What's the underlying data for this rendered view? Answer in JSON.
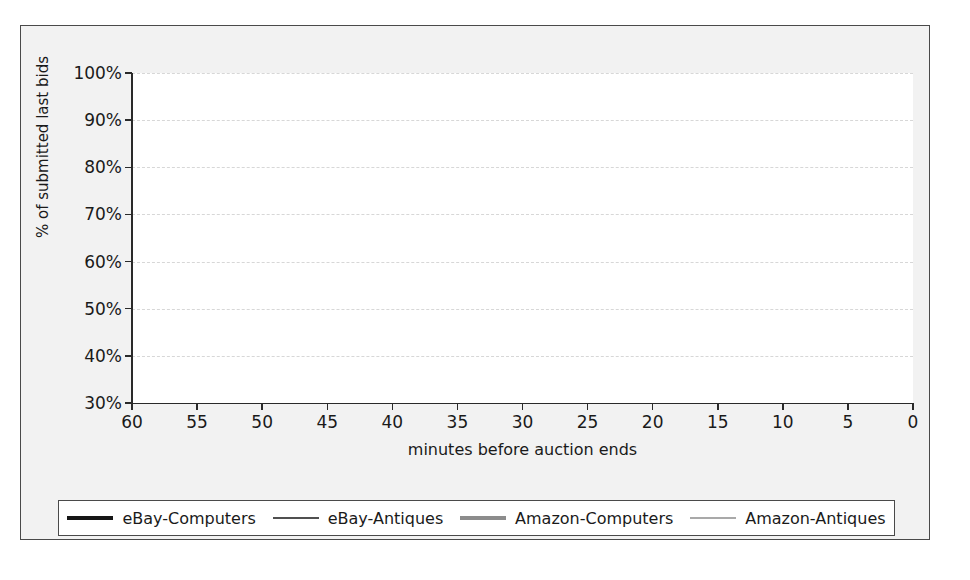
{
  "figure": {
    "background_color": "#f2f2f2",
    "plot_background_color": "#ffffff",
    "frame_color": "#4a4a4a"
  },
  "legend": {
    "position": "bottom",
    "items": [
      {
        "label": "eBay-Computers",
        "color": "#161616",
        "width": 4.2,
        "icon": "thick-black-line-icon"
      },
      {
        "label": "eBay-Antiques",
        "color": "#161616",
        "width": 1.4,
        "icon": "thin-black-line-icon"
      },
      {
        "label": "Amazon-Computers",
        "color": "#8c8c8c",
        "width": 4.2,
        "icon": "thick-gray-line-icon"
      },
      {
        "label": "Amazon-Antiques",
        "color": "#8c8c8c",
        "width": 1.4,
        "icon": "thin-gray-line-icon"
      }
    ]
  },
  "chart_data": {
    "type": "line",
    "title": "",
    "subtitle": "",
    "xlabel": "minutes before auction ends",
    "ylabel": "% of submitted last bids",
    "xlim": [
      60,
      0
    ],
    "ylim": [
      30,
      100
    ],
    "x_reversed": true,
    "grid": true,
    "gridlines": "horizontal-dashed",
    "xticks": [
      60,
      55,
      50,
      45,
      40,
      35,
      30,
      25,
      20,
      15,
      10,
      5,
      0
    ],
    "xtick_labels": [
      "60",
      "55",
      "50",
      "45",
      "40",
      "35",
      "30",
      "25",
      "20",
      "15",
      "10",
      "5",
      "0"
    ],
    "yticks": [
      30,
      40,
      50,
      60,
      70,
      80,
      90,
      100
    ],
    "ytick_labels": [
      "30%",
      "40%",
      "50%",
      "60%",
      "70%",
      "80%",
      "90%",
      "100%"
    ],
    "legend_position": "bottom-outside",
    "annotations": [],
    "series": [
      {
        "name": "eBay-Computers",
        "color": "#161616",
        "width": 4.2,
        "style": "step",
        "x": [
          60,
          57,
          55,
          54.5,
          52,
          50,
          49,
          47.5,
          46.5,
          45.5,
          44.5,
          43.5,
          42.5,
          41.5,
          40.5,
          39.5,
          38.5,
          37.5,
          36.5,
          35.5,
          34.5,
          33.5,
          32.5,
          31.5,
          30.5,
          29.5,
          28.5,
          27.5,
          26.5,
          25.5,
          24.5,
          23.5,
          22.5,
          21.5,
          20.5,
          19.5,
          18.5,
          17.5,
          17,
          13,
          12,
          11,
          10.5,
          10,
          9.5,
          9,
          8.5,
          8,
          7.5,
          7,
          6.5,
          6,
          5.5,
          5,
          4.5,
          4,
          3.5,
          3,
          2.5,
          2,
          1.5,
          1,
          0.6,
          0.3,
          0
        ],
        "y": [
          34.0,
          34.0,
          34.0,
          34.8,
          34.8,
          35.4,
          35.4,
          36.4,
          37.0,
          37.6,
          38.0,
          38.4,
          38.8,
          39.2,
          39.6,
          40.0,
          40.3,
          40.7,
          41.2,
          41.6,
          42.0,
          42.4,
          42.8,
          43.2,
          43.6,
          44.0,
          44.4,
          44.8,
          45.2,
          45.7,
          46.2,
          46.6,
          47.1,
          47.6,
          48.1,
          48.6,
          49.2,
          49.8,
          50.0,
          50.0,
          50.8,
          52.0,
          53.0,
          54.0,
          55.0,
          56.0,
          57.0,
          58.0,
          59.0,
          60.0,
          60.6,
          61.2,
          62.0,
          62.8,
          63.6,
          64.2,
          64.8,
          65.4,
          66.0,
          67.0,
          68.5,
          71.0,
          75.0,
          85.0,
          100.0
        ]
      },
      {
        "name": "eBay-Antiques",
        "color": "#161616",
        "width": 1.4,
        "style": "step",
        "x": [
          47,
          43,
          41,
          39,
          37,
          36.5,
          34.5,
          33.5,
          32.5,
          31.5,
          31,
          29,
          27.5,
          26.5,
          25,
          23,
          21,
          19.5,
          17.5,
          17,
          15.5,
          13.5,
          12.5,
          11.5,
          10.5,
          9.5,
          8.5,
          7.8,
          7.2,
          6.6,
          6.0,
          5.5,
          5.0,
          4.6,
          4.2,
          3.8,
          3.4,
          3.0,
          2.7,
          2.4,
          2.1,
          1.8,
          1.5,
          1.2,
          0.9,
          0.6,
          0.35,
          0.15,
          0
        ],
        "y": [
          30.8,
          30.8,
          31.1,
          31.1,
          31.5,
          32.0,
          32.0,
          32.5,
          32.5,
          33.0,
          34.2,
          34.2,
          34.6,
          35.4,
          35.4,
          35.8,
          35.8,
          36.6,
          36.6,
          37.3,
          37.3,
          37.5,
          38.0,
          38.6,
          39.4,
          40.4,
          41.4,
          42.4,
          43.2,
          44.2,
          45.2,
          46.2,
          47.2,
          48.2,
          49.2,
          50.2,
          51.4,
          52.6,
          53.8,
          55.0,
          56.4,
          58.0,
          60.0,
          62.5,
          66.0,
          71.0,
          78.0,
          90.0,
          100.0
        ]
      },
      {
        "name": "Amazon-Computers",
        "color": "#8c8c8c",
        "width": 4.2,
        "style": "step",
        "x": [
          60,
          55,
          52,
          50.5,
          49.5,
          49,
          48,
          46,
          44,
          42,
          40,
          38,
          36,
          34,
          32,
          30.5,
          29.5,
          28,
          26.5,
          25.5,
          24.5,
          23,
          21.5,
          20.5,
          19.5,
          18,
          17,
          16.5,
          15.5,
          15,
          14.5,
          14,
          13.5,
          13,
          12.5,
          12,
          11.5,
          11,
          10.5,
          10,
          9.5,
          9,
          8.5,
          8,
          7.5,
          7,
          6.5,
          6,
          5.5,
          5,
          4.5,
          4,
          3.5,
          3,
          2.5,
          2,
          1.5,
          1,
          0.5,
          0
        ],
        "y": [
          74.0,
          74.0,
          74.0,
          74.0,
          74.6,
          76.6,
          77.0,
          77.6,
          78.0,
          78.2,
          78.4,
          78.6,
          78.8,
          79.0,
          79.4,
          79.8,
          80.4,
          80.6,
          80.8,
          81.2,
          81.5,
          81.8,
          82.0,
          82.3,
          82.6,
          82.9,
          83.0,
          83.1,
          83.2,
          83.3,
          83.4,
          83.5,
          84.8,
          85.0,
          85.2,
          85.5,
          86.2,
          87.0,
          88.4,
          89.6,
          90.6,
          91.4,
          92.4,
          93.4,
          94.4,
          95.2,
          95.8,
          96.4,
          96.9,
          97.3,
          97.7,
          98.0,
          98.3,
          98.6,
          98.9,
          99.1,
          99.3,
          99.5,
          99.7,
          100.0
        ]
      },
      {
        "name": "Amazon-Antiques",
        "color": "#8c8c8c",
        "width": 1.4,
        "style": "step",
        "x": [
          60,
          56,
          53,
          50.5,
          49.5,
          48,
          46.5,
          45,
          43,
          41.5,
          40,
          38.5,
          37,
          35.5,
          34,
          32.5,
          31,
          30,
          29,
          27.5,
          26,
          24.5,
          23,
          21.5,
          20,
          18.5,
          17,
          16,
          15.5,
          15,
          14.5,
          14,
          13.5,
          13,
          12.5,
          12,
          11.5,
          11,
          10.5,
          10,
          9.5,
          9,
          8.5,
          8,
          7.5,
          7,
          6.5,
          6,
          5.5,
          5,
          4.5,
          4,
          3.5,
          3,
          2.5,
          2,
          1.5,
          1,
          0.5,
          0
        ],
        "y": [
          80.5,
          80.5,
          80.5,
          80.6,
          81.6,
          82.0,
          82.2,
          82.4,
          82.6,
          83.0,
          83.2,
          83.4,
          83.5,
          83.6,
          83.8,
          84.0,
          84.2,
          85.6,
          85.8,
          86.0,
          86.2,
          86.4,
          86.5,
          86.6,
          86.7,
          86.8,
          87.0,
          87.0,
          87.0,
          87.0,
          86.9,
          86.9,
          86.9,
          86.9,
          86.8,
          86.8,
          87.4,
          88.4,
          89.4,
          90.4,
          91.2,
          92.0,
          93.0,
          93.8,
          94.6,
          95.4,
          96.0,
          96.6,
          97.1,
          97.5,
          97.9,
          98.2,
          98.5,
          98.8,
          99.0,
          99.2,
          99.4,
          99.6,
          99.8,
          100.0
        ]
      }
    ]
  }
}
